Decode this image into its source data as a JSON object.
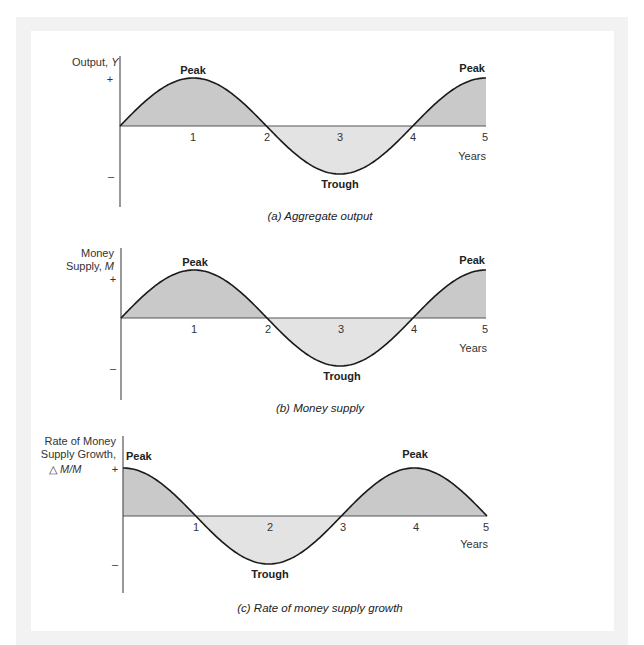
{
  "chart_data": [
    {
      "id": "a",
      "type": "area",
      "title": "(a) Aggregate output",
      "ylabel": [
        "Output, ",
        "Y"
      ],
      "xlabel": "Years",
      "x_ticks": [
        "1",
        "2",
        "3",
        "4",
        "5"
      ],
      "y_ticks": [
        "+",
        "–"
      ],
      "x": [
        0,
        0.5,
        1,
        1.5,
        2,
        2.5,
        3,
        3.5,
        4,
        4.5,
        5
      ],
      "values": [
        0,
        0.71,
        1,
        0.71,
        0,
        -0.71,
        -1,
        -0.71,
        0,
        0.71,
        1
      ],
      "function": "sin(pi*x/2)",
      "annotations": [
        {
          "text": "Peak",
          "x": 1,
          "y": 1
        },
        {
          "text": "Trough",
          "x": 3,
          "y": -1
        },
        {
          "text": "Peak",
          "x": 5,
          "y": 1
        }
      ],
      "xlim": [
        0,
        5
      ],
      "ylim": [
        -1,
        1
      ],
      "grid": false
    },
    {
      "id": "b",
      "type": "area",
      "title": "(b) Money supply",
      "ylabel": [
        "Money",
        "Supply, ",
        "M"
      ],
      "xlabel": "Years",
      "x_ticks": [
        "1",
        "2",
        "3",
        "4",
        "5"
      ],
      "y_ticks": [
        "+",
        "–"
      ],
      "x": [
        0,
        0.5,
        1,
        1.5,
        2,
        2.5,
        3,
        3.5,
        4,
        4.5,
        5
      ],
      "values": [
        0,
        0.71,
        1,
        0.71,
        0,
        -0.71,
        -1,
        -0.71,
        0,
        0.71,
        1
      ],
      "function": "sin(pi*x/2)",
      "annotations": [
        {
          "text": "Peak",
          "x": 1,
          "y": 1
        },
        {
          "text": "Trough",
          "x": 3,
          "y": -1
        },
        {
          "text": "Peak",
          "x": 5,
          "y": 1
        }
      ],
      "xlim": [
        0,
        5
      ],
      "ylim": [
        -1,
        1
      ],
      "grid": false
    },
    {
      "id": "c",
      "type": "area",
      "title": "(c) Rate of money supply growth",
      "ylabel": [
        "Rate of Money",
        "Supply Growth,",
        "△ M/M"
      ],
      "xlabel": "Years",
      "x_ticks": [
        "1",
        "2",
        "3",
        "4",
        "5"
      ],
      "y_ticks": [
        "+",
        "–"
      ],
      "x": [
        0,
        0.5,
        1,
        1.5,
        2,
        2.5,
        3,
        3.5,
        4,
        4.5,
        5
      ],
      "values": [
        1,
        0.71,
        0,
        -0.71,
        -1,
        -0.71,
        0,
        0.71,
        1,
        0.71,
        0
      ],
      "function": "cos(pi*x/2)",
      "annotations": [
        {
          "text": "Peak",
          "x": 0,
          "y": 1
        },
        {
          "text": "Trough",
          "x": 2,
          "y": -1
        },
        {
          "text": "Peak",
          "x": 4,
          "y": 1
        }
      ],
      "xlim": [
        0,
        5
      ],
      "ylim": [
        -1,
        1
      ],
      "grid": false
    }
  ],
  "labels": {
    "a": {
      "ylabel_text": "Output, ",
      "ylabel_var": "Y",
      "plus": "+",
      "minus": "–",
      "ticks": [
        "1",
        "2",
        "3",
        "4",
        "5"
      ],
      "years": "Years",
      "peak1": "Peak",
      "trough": "Trough",
      "peak2": "Peak",
      "caption": "(a) Aggregate output"
    },
    "b": {
      "ylabel_line1": "Money",
      "ylabel_line2": "Supply, ",
      "ylabel_var": "M",
      "plus": "+",
      "minus": "–",
      "ticks": [
        "1",
        "2",
        "3",
        "4",
        "5"
      ],
      "years": "Years",
      "peak1": "Peak",
      "trough": "Trough",
      "peak2": "Peak",
      "caption": "(b) Money supply"
    },
    "c": {
      "ylabel_line1": "Rate of Money",
      "ylabel_line2": "Supply Growth,",
      "ylabel_delta": "△",
      "ylabel_var": "M/M",
      "ylabel_var_prefix": "M",
      "ylabel_slash": "/",
      "ylabel_var_suffix": "M",
      "plus": "+",
      "minus": "–",
      "ticks": [
        "1",
        "2",
        "3",
        "4",
        "5"
      ],
      "years": "Years",
      "peak1": "Peak",
      "trough": "Trough",
      "peak2": "Peak",
      "caption": "(c) Rate of money supply growth"
    }
  },
  "colors": {
    "fill_positive": "#c9c9c9",
    "fill_negative": "#e3e3e3",
    "curve": "#1a1a1a",
    "axis": "#555555",
    "frame": "#f2f2f2"
  }
}
